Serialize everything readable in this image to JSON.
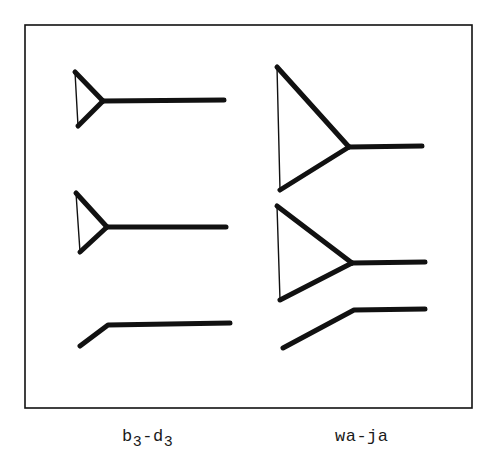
{
  "figure": {
    "frame": {
      "x1": 25,
      "y1": 25,
      "x2": 472,
      "y2": 408
    },
    "stroke_color": "#111111",
    "thick_width": 5,
    "thin_width": 1.4
  },
  "columns": [
    {
      "id": "left",
      "label": {
        "base1": "b",
        "sub1": "3",
        "sep": "-",
        "base2": "d",
        "sub2": "3",
        "full": "b3-d3"
      },
      "glyphs": [
        {
          "type": "triangle-with-stem",
          "top": [
            75,
            72
          ],
          "bottom": [
            78,
            126
          ],
          "apex": [
            103,
            101
          ],
          "stem_end": [
            224,
            100
          ]
        },
        {
          "type": "triangle-with-stem",
          "top": [
            76,
            193
          ],
          "bottom": [
            80,
            252
          ],
          "apex": [
            107,
            227
          ],
          "stem_end": [
            226,
            227
          ]
        },
        {
          "type": "bent-line",
          "points": [
            [
              80,
              346
            ],
            [
              108,
              325
            ],
            [
              230,
              323
            ]
          ]
        }
      ]
    },
    {
      "id": "right",
      "label": {
        "full": "wa-ja"
      },
      "glyphs": [
        {
          "type": "triangle-with-stem",
          "top": [
            277,
            67
          ],
          "bottom": [
            280,
            190
          ],
          "apex": [
            349,
            147
          ],
          "stem_end": [
            422,
            146
          ]
        },
        {
          "type": "triangle-with-stem",
          "top": [
            277,
            206
          ],
          "bottom": [
            280,
            300
          ],
          "apex": [
            352,
            263
          ],
          "stem_end": [
            425,
            262
          ]
        },
        {
          "type": "bent-line",
          "points": [
            [
              283,
              348
            ],
            [
              354,
              310
            ],
            [
              425,
              309
            ]
          ]
        }
      ]
    }
  ]
}
